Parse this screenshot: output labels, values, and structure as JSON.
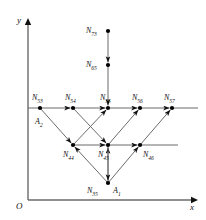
{
  "figure": {
    "kind": "node-lattice-diagram",
    "background": "#ffffff",
    "line_color": "#6b6b6b",
    "node_color": "#000000",
    "text_color": "#111111"
  },
  "axes": {
    "origin_label": "O",
    "x_label": "x",
    "y_label": "y",
    "y_axis": {
      "x": 28,
      "y_top": 18,
      "y_bottom": 200
    },
    "x_axis": {
      "y": 200,
      "x_left": 28,
      "x_right": 198
    }
  },
  "nodes": [
    {
      "id": "N73",
      "base": "N",
      "sub": "73",
      "x": 108,
      "y": 31,
      "label_dx": -22,
      "label_dy": -4,
      "dot": true
    },
    {
      "id": "N65",
      "base": "N",
      "sub": "65",
      "x": 108,
      "y": 65,
      "label_dx": -22,
      "label_dy": -4,
      "dot": true
    },
    {
      "id": "N53",
      "base": "N",
      "sub": "53",
      "x": 40,
      "y": 108,
      "label_dx": -8,
      "label_dy": -14,
      "dot": true
    },
    {
      "id": "N54",
      "base": "N",
      "sub": "54",
      "x": 73,
      "y": 108,
      "label_dx": -8,
      "label_dy": -14,
      "dot": true
    },
    {
      "id": "N55",
      "base": "N",
      "sub": "55",
      "x": 108,
      "y": 108,
      "label_dx": -8,
      "label_dy": -14,
      "dot": true
    },
    {
      "id": "N56",
      "base": "N",
      "sub": "56",
      "x": 140,
      "y": 108,
      "label_dx": -8,
      "label_dy": -14,
      "dot": true
    },
    {
      "id": "N57",
      "base": "N",
      "sub": "57",
      "x": 172,
      "y": 108,
      "label_dx": -8,
      "label_dy": -14,
      "dot": true
    },
    {
      "id": "N44",
      "base": "N",
      "sub": "44",
      "x": 73,
      "y": 145,
      "label_dx": -10,
      "label_dy": 6,
      "dot": true
    },
    {
      "id": "N45",
      "base": "N",
      "sub": "45",
      "x": 108,
      "y": 145,
      "label_dx": -10,
      "label_dy": 6,
      "dot": true
    },
    {
      "id": "N46",
      "base": "N",
      "sub": "46",
      "x": 140,
      "y": 145,
      "label_dx": 3,
      "label_dy": 6,
      "dot": true
    },
    {
      "id": "N35",
      "base": "N",
      "sub": "35",
      "x": 108,
      "y": 183,
      "label_dx": -21,
      "label_dy": 4,
      "dot": true
    }
  ],
  "point_labels": [
    {
      "id": "A1",
      "base": "A",
      "sub": "1",
      "x": 113,
      "y": 187
    },
    {
      "id": "A2",
      "base": "A",
      "sub": "2",
      "x": 35,
      "y": 118
    }
  ],
  "edges": [
    {
      "from": "N73",
      "to": "N65",
      "arrow": true
    },
    {
      "from": "N65",
      "to": "N55",
      "arrow": true
    },
    {
      "from": "N53",
      "to": "N54",
      "arrow": true
    },
    {
      "from": "N54",
      "to": "N55",
      "arrow": true
    },
    {
      "from": "N55",
      "to": "N56",
      "arrow": true
    },
    {
      "from": "N56",
      "to": "N57",
      "arrow": true
    },
    {
      "from": "N44",
      "to": "N45",
      "arrow": true
    },
    {
      "from": "N45",
      "to": "N46",
      "arrow": true
    },
    {
      "from": "N53",
      "to": "N44",
      "arrow": true
    },
    {
      "from": "N54",
      "to": "N45",
      "arrow": true
    },
    {
      "from": "N44",
      "to": "N55",
      "arrow": true
    },
    {
      "from": "N45",
      "to": "N56",
      "arrow": true
    },
    {
      "from": "N46",
      "to": "N57",
      "arrow": true
    },
    {
      "from": "N35",
      "to": "N44",
      "arrow": true
    },
    {
      "from": "N35",
      "to": "N45",
      "arrow": true
    },
    {
      "from": "N35",
      "to": "N46",
      "arrow": true
    },
    {
      "from": "N45",
      "to": "N35",
      "arrow": true
    }
  ],
  "axis_extensions": [
    {
      "name": "row5-left-stub",
      "x1": 28,
      "y1": 108,
      "x2": 40,
      "y2": 108
    },
    {
      "name": "row5-right-stub",
      "x1": 172,
      "y1": 108,
      "x2": 198,
      "y2": 108
    },
    {
      "name": "row4-right-stub",
      "x1": 140,
      "y1": 145,
      "x2": 178,
      "y2": 145
    }
  ]
}
